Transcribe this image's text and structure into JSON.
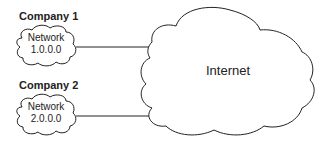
{
  "diagram": {
    "companies": [
      {
        "title": "Company 1",
        "network_label": "Network",
        "network_address": "1.0.0.0"
      },
      {
        "title": "Company 2",
        "network_label": "Network",
        "network_address": "2.0.0.0"
      }
    ],
    "internet_label": "Internet",
    "colors": {
      "stroke": "#222222",
      "background": "#ffffff"
    }
  }
}
